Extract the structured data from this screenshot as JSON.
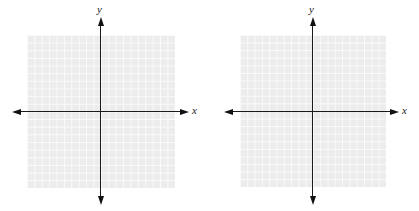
{
  "figure": {
    "panels": [
      {
        "id": "left",
        "x_label": "x",
        "y_label": "y",
        "grid_cells": 20,
        "grid": {
          "left": 27,
          "top": 35,
          "width": 148,
          "height": 153
        },
        "origin": {
          "x": 101,
          "y": 112
        },
        "x_axis": {
          "from": 13,
          "to": 188
        },
        "y_axis": {
          "from": 18,
          "to": 204
        },
        "x_label_pos": {
          "x": 191,
          "y": 105
        },
        "y_label_pos": {
          "x": 97,
          "y": 5
        }
      },
      {
        "id": "right",
        "x_label": "x",
        "y_label": "y",
        "grid_cells": 20,
        "grid": {
          "left": 240,
          "top": 35,
          "width": 146,
          "height": 152
        },
        "origin": {
          "x": 312,
          "y": 112
        },
        "x_axis": {
          "from": 225,
          "to": 398
        },
        "y_axis": {
          "from": 18,
          "to": 204
        },
        "x_label_pos": {
          "x": 402,
          "y": 105
        },
        "y_label_pos": {
          "x": 309,
          "y": 5
        }
      }
    ],
    "colors": {
      "grid_fill": "#ececec",
      "grid_lines": "#fafafa",
      "axes": "#1a1a1a",
      "background": "#ffffff"
    }
  }
}
